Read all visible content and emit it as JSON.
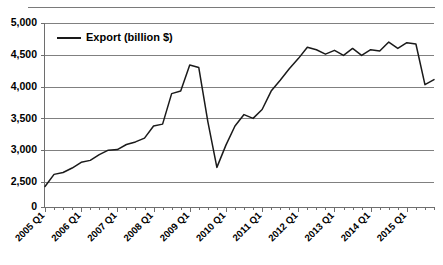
{
  "chart_data": {
    "type": "line",
    "title": "",
    "xlabel": "",
    "ylabel": "",
    "legend": [
      "Export (billion $)"
    ],
    "legend_position": "top-left-inside",
    "grid": true,
    "y_axis_broken": true,
    "y_break_note": "axis shows 0 then jumps to 2,500",
    "ylim": [
      2300,
      5000
    ],
    "ytick_labels": [
      "5,000",
      "4,500",
      "4,000",
      "3,500",
      "3,000",
      "2,500",
      "0"
    ],
    "ytick_values": [
      5000,
      4500,
      4000,
      3500,
      3000,
      2500,
      0
    ],
    "xtick_labels": [
      "2005 Q1",
      "2006 Q1",
      "2007 Q1",
      "2008 Q1",
      "2009 Q1",
      "2010 Q1",
      "2011 Q1",
      "2012 Q1",
      "2013 Q1",
      "2014 Q1",
      "2015 Q1"
    ],
    "x": [
      "2005 Q1",
      "2005 Q2",
      "2005 Q3",
      "2005 Q4",
      "2006 Q1",
      "2006 Q2",
      "2006 Q3",
      "2006 Q4",
      "2007 Q1",
      "2007 Q2",
      "2007 Q3",
      "2007 Q4",
      "2008 Q1",
      "2008 Q2",
      "2008 Q3",
      "2008 Q4",
      "2009 Q1",
      "2009 Q2",
      "2009 Q3",
      "2009 Q4",
      "2010 Q1",
      "2010 Q2",
      "2010 Q3",
      "2010 Q4",
      "2011 Q1",
      "2011 Q2",
      "2011 Q3",
      "2011 Q4",
      "2012 Q1",
      "2012 Q2",
      "2012 Q3",
      "2012 Q4",
      "2013 Q1",
      "2013 Q2",
      "2013 Q3",
      "2013 Q4",
      "2014 Q1",
      "2014 Q2",
      "2014 Q3",
      "2014 Q4",
      "2015 Q1",
      "2015 Q2",
      "2015 Q3",
      "2015 Q4"
    ],
    "series": [
      {
        "name": "Export (billion $)",
        "color": "#1a1a1a",
        "values": [
          2430,
          2620,
          2650,
          2720,
          2810,
          2840,
          2930,
          3000,
          3010,
          3090,
          3130,
          3190,
          3380,
          3410,
          3890,
          3930,
          4340,
          4300,
          3450,
          2730,
          3080,
          3380,
          3560,
          3500,
          3640,
          3930,
          4100,
          4280,
          4440,
          4620,
          4580,
          4510,
          4570,
          4490,
          4600,
          4490,
          4580,
          4560,
          4700,
          4600,
          4690,
          4670,
          4030,
          4110
        ]
      }
    ]
  },
  "legend": {
    "entry_label": "Export (billion $)"
  },
  "colors": {
    "series": "#1a1a1a",
    "gridline": "#808080",
    "axis": "#6e6e6e",
    "background": "#ffffff"
  }
}
